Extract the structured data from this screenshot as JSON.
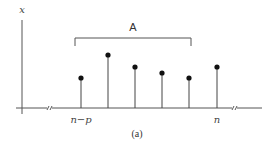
{
  "figure": {
    "caption": "(a)",
    "y_axis_label": "x",
    "bracket_label": "A",
    "x_tick_labels": [
      {
        "label": "n−p",
        "x": 81
      },
      {
        "label": "n",
        "x": 217
      }
    ],
    "colors": {
      "axis": "#555555",
      "stem": "#444444",
      "dot": "#111111",
      "text": "#333333"
    }
  },
  "chart_data": {
    "type": "stem",
    "title": "",
    "caption": "(a)",
    "ylabel": "x",
    "xlabel": "",
    "x_labels": [
      "n−p",
      "",
      "",
      "",
      "",
      "n"
    ],
    "x": [
      0,
      1,
      2,
      3,
      4,
      5
    ],
    "values": [
      0.45,
      0.73,
      0.58,
      0.51,
      0.45,
      0.58
    ],
    "bracket": {
      "label": "A",
      "from_index": 0,
      "to_index": 4
    },
    "axis_breaks": 2,
    "grid": false
  },
  "stems": [
    {
      "x": 81,
      "top": 78
    },
    {
      "x": 108,
      "top": 55
    },
    {
      "x": 135,
      "top": 67
    },
    {
      "x": 162,
      "top": 73
    },
    {
      "x": 189,
      "top": 78
    },
    {
      "x": 217,
      "top": 67
    }
  ]
}
